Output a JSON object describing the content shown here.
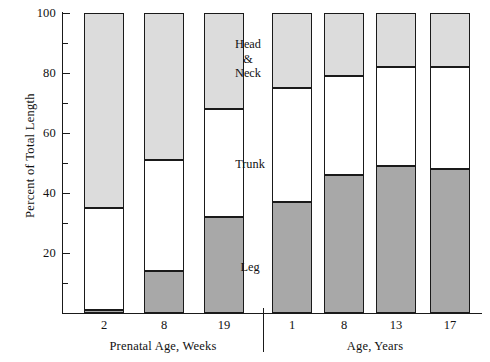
{
  "chart_data": {
    "type": "bar",
    "subtype": "stacked-percent",
    "title": "",
    "xlabel": "",
    "ylabel": "Percent of Total Length",
    "ylim": [
      0,
      100
    ],
    "grid": false,
    "legend_position": "in-plot-annotations",
    "categories": [
      "2",
      "8",
      "19",
      "1",
      "8",
      "13",
      "17"
    ],
    "groups": [
      {
        "label": "Prenatal Age, Weeks",
        "categories": [
          "2",
          "8",
          "19"
        ]
      },
      {
        "label": "Age, Years",
        "categories": [
          "1",
          "8",
          "13",
          "17"
        ]
      }
    ],
    "series": [
      {
        "name": "Leg",
        "color": "#a8a8a8",
        "values": [
          1,
          14,
          32,
          37,
          46,
          49,
          48
        ]
      },
      {
        "name": "Trunk",
        "color": "#ffffff",
        "values": [
          34,
          37,
          36,
          38,
          33,
          33,
          34
        ]
      },
      {
        "name": "Head & Neck",
        "color": "#dcdcdc",
        "values": [
          65,
          49,
          32,
          25,
          21,
          18,
          18
        ]
      }
    ],
    "boundaries": {
      "note": "cumulative percent of total length from baseline",
      "leg_top": [
        1,
        14,
        32,
        37,
        46,
        49,
        48
      ],
      "trunk_top": [
        35,
        51,
        68,
        75,
        79,
        82,
        82
      ]
    },
    "y_major_ticks": [
      20,
      40,
      60,
      80,
      100
    ],
    "y_minor_ticks": [
      10,
      30,
      50,
      70,
      90
    ],
    "y_tick_labels": [
      "20",
      "40",
      "60",
      "80",
      "100"
    ],
    "annotations": [
      {
        "text_lines": [
          "Head",
          "&",
          "Neck"
        ],
        "segment": "Head & Neck"
      },
      {
        "text_lines": [
          "Trunk"
        ],
        "segment": "Trunk"
      },
      {
        "text_lines": [
          "Leg"
        ],
        "segment": "Leg"
      }
    ],
    "colors": {
      "head_neck": "#dcdcdc",
      "trunk": "#ffffff",
      "leg": "#a8a8a8",
      "outline": "#1a1a1a",
      "background": "#ffffff"
    }
  }
}
